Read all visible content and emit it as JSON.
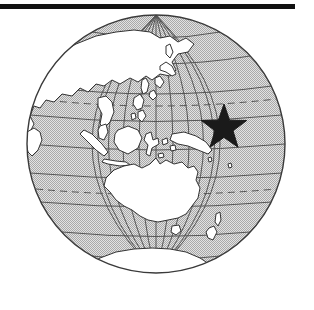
{
  "figure": {
    "type": "locator-globe-map",
    "projection": "orthographic",
    "title": "",
    "description": "Orthographic globe centred on the western Pacific showing Asia, Indonesia, Australia, New Zealand and Antarctica, with a black star marking a location in the Pacific Ocean east of New Guinea."
  },
  "top_rule": {
    "label": "horizontal-rule",
    "width_px": 295,
    "thickness_px": 5,
    "color": "#111111"
  },
  "globe": {
    "center_x": 156,
    "center_y": 144,
    "radius": 129,
    "outline_color": "#3a3a3a",
    "ocean_fill": "#c8c8c8",
    "ocean_pattern": "stipple-halftone",
    "land_fill": "#ffffff",
    "land_outline_color": "#333333",
    "graticule_color": "#4a4a4a",
    "graticule_spacing_degrees": 15,
    "center_longitude": 130,
    "center_latitude": 0
  },
  "graticule": {
    "equator_label": "Equator",
    "equator_y": 119,
    "tropic_of_cancer_label": "Tropic of Cancer",
    "tropic_of_cancer_y": 61,
    "tropic_of_capricorn_label": "Tropic of Capricorn",
    "tropic_of_capricorn_y": 167,
    "dashed_lines": [
      "Tropic of Cancer",
      "Tropic of Capricorn"
    ],
    "solid_lines": [
      "Equator",
      "parallels",
      "meridians"
    ]
  },
  "marker": {
    "name": "location-star",
    "shape": "five-pointed-star",
    "color": "#1a1a1a",
    "center_x": 224,
    "center_y": 121,
    "radius": 17,
    "region": "Pacific Ocean"
  },
  "landmasses": [
    {
      "name": "asia-mainland"
    },
    {
      "name": "japan"
    },
    {
      "name": "korea"
    },
    {
      "name": "philippines"
    },
    {
      "name": "indochina"
    },
    {
      "name": "borneo"
    },
    {
      "name": "sumatra"
    },
    {
      "name": "java"
    },
    {
      "name": "sulawesi"
    },
    {
      "name": "new-guinea"
    },
    {
      "name": "australia"
    },
    {
      "name": "tasmania"
    },
    {
      "name": "new-zealand"
    },
    {
      "name": "antarctica"
    },
    {
      "name": "india"
    }
  ]
}
